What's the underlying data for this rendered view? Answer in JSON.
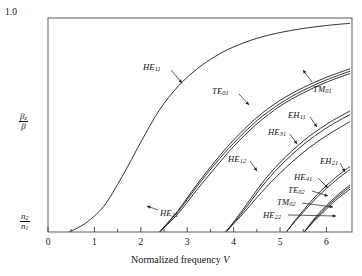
{
  "chart_data": {
    "type": "line",
    "title": "",
    "xlabel": "Normalized frequency V",
    "ylabel_top": "beta_z / beta",
    "ylabel_bottom": "n2 / n1",
    "xlim": [
      0,
      6.55
    ],
    "ylim": [
      0,
      1
    ],
    "x_ticks": [
      0,
      1,
      2,
      3,
      4,
      5,
      6
    ],
    "x_tick_labels": [
      "0",
      "1",
      "2",
      "3",
      "4",
      "5",
      "6"
    ],
    "x_minor_ticks": [
      0.5,
      1.5,
      2.5,
      3.5,
      4.5,
      5.5
    ],
    "y_tick_labels": [
      "1.0"
    ],
    "y_axis_top_label": "1.0",
    "grid": false,
    "legend": "inline-annotations",
    "series": [
      {
        "name": "HE11",
        "cutoff_V": 0.45,
        "label": "HE",
        "sub": "11",
        "points": [
          [
            0.45,
            0.0
          ],
          [
            0.8,
            0.04
          ],
          [
            1.2,
            0.12
          ],
          [
            1.6,
            0.26
          ],
          [
            2.0,
            0.42
          ],
          [
            2.4,
            0.57
          ],
          [
            2.8,
            0.68
          ],
          [
            3.2,
            0.76
          ],
          [
            3.6,
            0.82
          ],
          [
            4.0,
            0.865
          ],
          [
            4.5,
            0.905
          ],
          [
            5.0,
            0.932
          ],
          [
            5.5,
            0.951
          ],
          [
            6.0,
            0.965
          ],
          [
            6.5,
            0.975
          ]
        ]
      },
      {
        "name": "TE01",
        "cutoff_V": 2.405,
        "label": "TE",
        "sub": "01",
        "points": [
          [
            2.405,
            0.0
          ],
          [
            2.8,
            0.1
          ],
          [
            3.2,
            0.22
          ],
          [
            3.6,
            0.33
          ],
          [
            4.0,
            0.43
          ],
          [
            4.5,
            0.535
          ],
          [
            5.0,
            0.615
          ],
          [
            5.5,
            0.675
          ],
          [
            6.0,
            0.723
          ],
          [
            6.5,
            0.762
          ]
        ]
      },
      {
        "name": "HE21",
        "cutoff_V": 2.405,
        "label": "HE",
        "sub": "21",
        "points": [
          [
            2.405,
            0.0
          ],
          [
            2.8,
            0.085
          ],
          [
            3.2,
            0.195
          ],
          [
            3.6,
            0.3
          ],
          [
            4.0,
            0.4
          ],
          [
            4.5,
            0.505
          ],
          [
            5.0,
            0.588
          ],
          [
            5.5,
            0.65
          ],
          [
            6.0,
            0.7
          ],
          [
            6.5,
            0.74
          ]
        ]
      },
      {
        "name": "TM01",
        "cutoff_V": 2.405,
        "label": "TM",
        "sub": "01",
        "points": [
          [
            2.405,
            0.0
          ],
          [
            2.8,
            0.095
          ],
          [
            3.2,
            0.21
          ],
          [
            3.6,
            0.318
          ],
          [
            4.0,
            0.415
          ],
          [
            4.5,
            0.52
          ],
          [
            5.0,
            0.6
          ],
          [
            5.5,
            0.662
          ],
          [
            6.0,
            0.711
          ],
          [
            6.5,
            0.751
          ]
        ]
      },
      {
        "name": "EH11",
        "cutoff_V": 3.832,
        "label": "EH",
        "sub": "11",
        "points": [
          [
            3.832,
            0.0
          ],
          [
            4.2,
            0.105
          ],
          [
            4.6,
            0.225
          ],
          [
            5.0,
            0.325
          ],
          [
            5.5,
            0.425
          ],
          [
            6.0,
            0.503
          ],
          [
            6.5,
            0.565
          ]
        ]
      },
      {
        "name": "HE31",
        "cutoff_V": 3.832,
        "label": "HE",
        "sub": "31",
        "points": [
          [
            3.832,
            0.0
          ],
          [
            4.2,
            0.095
          ],
          [
            4.6,
            0.21
          ],
          [
            5.0,
            0.308
          ],
          [
            5.5,
            0.408
          ],
          [
            6.0,
            0.486
          ],
          [
            6.5,
            0.548
          ]
        ]
      },
      {
        "name": "HE12",
        "cutoff_V": 3.832,
        "label": "HE",
        "sub": "12",
        "points": [
          [
            3.832,
            0.0
          ],
          [
            4.2,
            0.085
          ],
          [
            4.6,
            0.185
          ],
          [
            5.0,
            0.275
          ],
          [
            5.5,
            0.372
          ],
          [
            6.0,
            0.45
          ],
          [
            6.5,
            0.515
          ]
        ]
      },
      {
        "name": "EH21",
        "cutoff_V": 5.136,
        "label": "EH",
        "sub": "21",
        "points": [
          [
            5.136,
            0.0
          ],
          [
            5.4,
            0.075
          ],
          [
            5.8,
            0.175
          ],
          [
            6.2,
            0.255
          ],
          [
            6.5,
            0.305
          ]
        ]
      },
      {
        "name": "HE41",
        "cutoff_V": 5.136,
        "label": "HE",
        "sub": "41",
        "points": [
          [
            5.136,
            0.0
          ],
          [
            5.4,
            0.068
          ],
          [
            5.8,
            0.163
          ],
          [
            6.2,
            0.241
          ],
          [
            6.5,
            0.291
          ]
        ]
      },
      {
        "name": "TE02",
        "cutoff_V": 5.52,
        "label": "TE",
        "sub": "02",
        "points": [
          [
            5.52,
            0.0
          ],
          [
            5.8,
            0.078
          ],
          [
            6.2,
            0.165
          ],
          [
            6.5,
            0.218
          ]
        ]
      },
      {
        "name": "TM02",
        "cutoff_V": 5.52,
        "label": "TM",
        "sub": "02",
        "points": [
          [
            5.52,
            0.0
          ],
          [
            5.8,
            0.072
          ],
          [
            6.2,
            0.157
          ],
          [
            6.5,
            0.209
          ]
        ]
      },
      {
        "name": "HE22",
        "cutoff_V": 5.52,
        "label": "HE",
        "sub": "22",
        "points": [
          [
            5.52,
            0.0
          ],
          [
            5.8,
            0.065
          ],
          [
            6.2,
            0.148
          ],
          [
            6.5,
            0.199
          ]
        ]
      }
    ],
    "annotations": [
      {
        "id": "HE11",
        "label": "HE",
        "sub": "11",
        "lx": 143,
        "ly": 62,
        "ax1": 171,
        "ay1": 70,
        "ax2": 182,
        "ay2": 83
      },
      {
        "id": "TE01",
        "label": "TE",
        "sub": "01",
        "lx": 212,
        "ly": 86,
        "ax1": 239,
        "ay1": 94,
        "ax2": 249,
        "ay2": 105
      },
      {
        "id": "TM01",
        "label": "TM",
        "sub": "01",
        "lx": 313,
        "ly": 84,
        "ax1": 312,
        "ay1": 82,
        "ax2": 303,
        "ay2": 70
      },
      {
        "id": "EH11",
        "label": "EH",
        "sub": "11",
        "lx": 288,
        "ly": 110,
        "ax1": 310,
        "ay1": 117,
        "ax2": 317,
        "ay2": 127
      },
      {
        "id": "HE31",
        "label": "HE",
        "sub": "31",
        "lx": 268,
        "ly": 127,
        "ax1": 290,
        "ay1": 134,
        "ax2": 297,
        "ay2": 144
      },
      {
        "id": "HE12",
        "label": "HE",
        "sub": "12",
        "lx": 228,
        "ly": 154,
        "ax1": 250,
        "ay1": 161,
        "ax2": 257,
        "ay2": 171
      },
      {
        "id": "EH21",
        "label": "EH",
        "sub": "21",
        "lx": 320,
        "ly": 156,
        "ax1": 340,
        "ay1": 163,
        "ax2": 345,
        "ay2": 172
      },
      {
        "id": "HE41",
        "label": "HE",
        "sub": "41",
        "lx": 294,
        "ly": 172,
        "ax1": 318,
        "ay1": 178,
        "ax2": 328,
        "ay2": 188
      },
      {
        "id": "TE02",
        "label": "TE",
        "sub": "02",
        "lx": 288,
        "ly": 185,
        "ax1": 312,
        "ay1": 191,
        "ax2": 328,
        "ay2": 196
      },
      {
        "id": "TM02",
        "label": "TM",
        "sub": "02",
        "lx": 277,
        "ly": 197,
        "ax1": 302,
        "ay1": 203,
        "ax2": 333,
        "ay2": 207
      },
      {
        "id": "HE22",
        "label": "HE",
        "sub": "22",
        "lx": 263,
        "ly": 210,
        "ax1": 288,
        "ay1": 215,
        "ax2": 336,
        "ay2": 216
      },
      {
        "id": "HE21",
        "label": "HE",
        "sub": "21",
        "lx": 160,
        "ly": 208,
        "ax1": 158,
        "ay1": 210,
        "ax2": 147,
        "ay2": 206
      }
    ]
  },
  "axes": {
    "y_top_label": "1.0",
    "y_upper_fraction": {
      "numerator": "β",
      "numerator_sub": "z",
      "denominator": "β"
    },
    "y_lower_fraction": {
      "numerator": "n",
      "numerator_sub": "2",
      "denominator": "n",
      "denominator_sub": "1"
    },
    "x_title_text": "Normalized frequency ",
    "x_title_italic": "V",
    "x_tick_labels": [
      "0",
      "1",
      "2",
      "3",
      "4",
      "5",
      "6"
    ]
  },
  "colors": {
    "background": "#ffffff",
    "frame": "#555555",
    "curve": "#1a1a1a",
    "text": "#111111"
  }
}
